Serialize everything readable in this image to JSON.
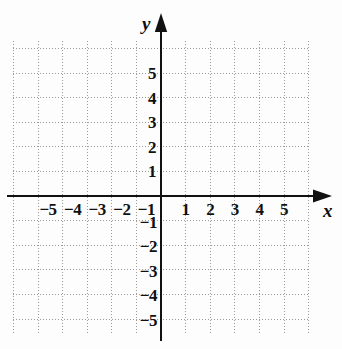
{
  "figure": {
    "kind": "cartesian-coordinate-grid",
    "axis_labels": {
      "x": "x",
      "y": "y"
    },
    "colors": {
      "background": "#fdfdfd",
      "axis": "#111111",
      "grid": "#9a9a9a",
      "text": "#111111"
    }
  },
  "chart_data": {
    "type": "scatter",
    "title": "",
    "xlabel": "x",
    "ylabel": "y",
    "x": [],
    "y": [],
    "series": [],
    "xlim": [
      -6,
      6
    ],
    "ylim": [
      -6,
      6
    ],
    "xticks": [
      -5,
      -4,
      -3,
      -2,
      -1,
      1,
      2,
      3,
      4,
      5
    ],
    "yticks": [
      5,
      4,
      3,
      2,
      1,
      -1,
      -2,
      -3,
      -4,
      -5
    ],
    "xticklabels": [
      "−5",
      "−4",
      "−3",
      "−2",
      "−1",
      "1",
      "2",
      "3",
      "4",
      "5"
    ],
    "yticklabels": [
      "5",
      "4",
      "3",
      "2",
      "1",
      "−1",
      "−2",
      "−3",
      "−4",
      "−5"
    ],
    "grid": true,
    "grid_style": "dotted",
    "grid_step": 1,
    "legend": null,
    "annotations": [],
    "axis_arrows": {
      "x_positive": true,
      "y_positive": true
    }
  },
  "ticks": {
    "x_negative": [
      {
        "value": -5,
        "label": "−5"
      },
      {
        "value": -4,
        "label": "−4"
      },
      {
        "value": -3,
        "label": "−3"
      },
      {
        "value": -2,
        "label": "−2"
      },
      {
        "value": -1,
        "label": "−1"
      }
    ],
    "x_positive": [
      {
        "value": 1,
        "label": "1"
      },
      {
        "value": 2,
        "label": "2"
      },
      {
        "value": 3,
        "label": "3"
      },
      {
        "value": 4,
        "label": "4"
      },
      {
        "value": 5,
        "label": "5"
      }
    ],
    "y_positive": [
      {
        "value": 5,
        "label": "5"
      },
      {
        "value": 4,
        "label": "4"
      },
      {
        "value": 3,
        "label": "3"
      },
      {
        "value": 2,
        "label": "2"
      },
      {
        "value": 1,
        "label": "1"
      }
    ],
    "y_negative": [
      {
        "value": -1,
        "label": "−1"
      },
      {
        "value": -2,
        "label": "−2"
      },
      {
        "value": -3,
        "label": "−3"
      },
      {
        "value": -4,
        "label": "−4"
      },
      {
        "value": -5,
        "label": "−5"
      }
    ]
  }
}
